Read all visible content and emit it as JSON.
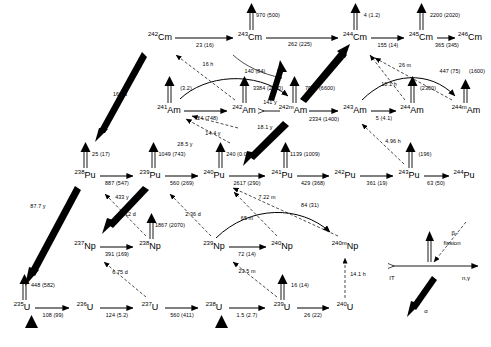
{
  "diagram": {
    "colors": {
      "ink": "#000000",
      "background": "#ffffff"
    },
    "nuclides": [
      {
        "id": "cm242",
        "a": "242",
        "el": "Cm",
        "x": 160,
        "y": 37
      },
      {
        "id": "cm243",
        "a": "243",
        "el": "Cm",
        "x": 250,
        "y": 37
      },
      {
        "id": "cm244",
        "a": "244",
        "el": "Cm",
        "x": 355,
        "y": 37
      },
      {
        "id": "cm245",
        "a": "245",
        "el": "Cm",
        "x": 421,
        "y": 37
      },
      {
        "id": "cm246",
        "a": "246",
        "el": "Cm",
        "x": 470,
        "y": 37
      },
      {
        "id": "am241",
        "a": "241",
        "el": "Am",
        "x": 169,
        "y": 110
      },
      {
        "id": "am242",
        "a": "242",
        "el": "Am",
        "x": 244,
        "y": 110
      },
      {
        "id": "am242m",
        "a": "242m",
        "el": "Am",
        "x": 293,
        "y": 110
      },
      {
        "id": "am243",
        "a": "243",
        "el": "Am",
        "x": 355,
        "y": 110
      },
      {
        "id": "am244",
        "a": "244",
        "el": "Am",
        "x": 412,
        "y": 110
      },
      {
        "id": "am244m",
        "a": "244m",
        "el": "Am",
        "x": 466,
        "y": 110
      },
      {
        "id": "pu238",
        "a": "238",
        "el": "Pu",
        "x": 85,
        "y": 175
      },
      {
        "id": "pu239",
        "a": "239",
        "el": "Pu",
        "x": 150,
        "y": 175
      },
      {
        "id": "pu240",
        "a": "240",
        "el": "Pu",
        "x": 214,
        "y": 175
      },
      {
        "id": "pu241",
        "a": "241",
        "el": "Pu",
        "x": 282,
        "y": 175
      },
      {
        "id": "pu242",
        "a": "242",
        "el": "Pu",
        "x": 345,
        "y": 175
      },
      {
        "id": "pu243",
        "a": "243",
        "el": "Pu",
        "x": 409,
        "y": 175
      },
      {
        "id": "pu244",
        "a": "244",
        "el": "Pu",
        "x": 464,
        "y": 175
      },
      {
        "id": "np237",
        "a": "237",
        "el": "Np",
        "x": 85,
        "y": 246
      },
      {
        "id": "np238",
        "a": "238",
        "el": "Np",
        "x": 150,
        "y": 246
      },
      {
        "id": "np239",
        "a": "239",
        "el": "Np",
        "x": 214,
        "y": 246
      },
      {
        "id": "np240",
        "a": "240",
        "el": "Np",
        "x": 282,
        "y": 246
      },
      {
        "id": "np240m",
        "a": "240m",
        "el": "Np",
        "x": 345,
        "y": 246
      },
      {
        "id": "u235",
        "a": "235",
        "el": "U",
        "x": 22,
        "y": 307
      },
      {
        "id": "u236",
        "a": "236",
        "el": "U",
        "x": 85,
        "y": 307
      },
      {
        "id": "u237",
        "a": "237",
        "el": "U",
        "x": 150,
        "y": 307
      },
      {
        "id": "u238",
        "a": "238",
        "el": "U",
        "x": 214,
        "y": 307
      },
      {
        "id": "u239",
        "a": "239",
        "el": "U",
        "x": 282,
        "y": 307
      },
      {
        "id": "u240",
        "a": "240",
        "el": "U",
        "x": 345,
        "y": 307
      }
    ],
    "capture_labels": [
      {
        "id": "cm242-cm243",
        "text": "23 (16)",
        "x": 205,
        "y": 46
      },
      {
        "id": "cm243-cm244",
        "text": "262 (225)",
        "x": 300,
        "y": 45
      },
      {
        "id": "cm244-cm245",
        "text": "155 (14)",
        "x": 388,
        "y": 46
      },
      {
        "id": "cm245-cm246",
        "text": "365 (345)",
        "x": 447,
        "y": 46
      },
      {
        "id": "am241-am242",
        "text": "724 (748)",
        "x": 206,
        "y": 119
      },
      {
        "id": "am242m-am243",
        "text": "2334 (1400)",
        "x": 324,
        "y": 120
      },
      {
        "id": "am243-am244",
        "text": "5 (4.1)",
        "x": 384,
        "y": 119
      },
      {
        "id": "pu238-pu239",
        "text": "887 (547)",
        "x": 117,
        "y": 184
      },
      {
        "id": "pu239-pu240",
        "text": "560 (269)",
        "x": 182,
        "y": 184
      },
      {
        "id": "pu240-pu241",
        "text": "2617 (290)",
        "x": 247,
        "y": 184
      },
      {
        "id": "pu241-pu242",
        "text": "429 (368)",
        "x": 313,
        "y": 184
      },
      {
        "id": "pu242-pu243",
        "text": "361 (19)",
        "x": 377,
        "y": 184
      },
      {
        "id": "pu243-pu244",
        "text": "63 (50)",
        "x": 436,
        "y": 184
      },
      {
        "id": "np237-np238",
        "text": "391 (169)",
        "x": 117,
        "y": 255
      },
      {
        "id": "np239-np240",
        "text": "72 (14)",
        "x": 247,
        "y": 255
      },
      {
        "id": "u235-u236",
        "text": "108 (99)",
        "x": 53,
        "y": 316
      },
      {
        "id": "u236-u237",
        "text": "124 (5.2)",
        "x": 117,
        "y": 316
      },
      {
        "id": "u237-u238",
        "text": "560 (411)",
        "x": 182,
        "y": 316
      },
      {
        "id": "u238-u239",
        "text": "1.5 (2.7)",
        "x": 247,
        "y": 316
      },
      {
        "id": "u239-u240",
        "text": "26 (22)",
        "x": 313,
        "y": 316
      }
    ],
    "fission_labels": [
      {
        "id": "cm243-fission",
        "text": "970 (500)",
        "x": 268,
        "y": 16
      },
      {
        "id": "cm244-fission",
        "text": "4 (1.2)",
        "x": 372,
        "y": 16
      },
      {
        "id": "cm245-fission",
        "text": "2200 (2020)",
        "x": 443,
        "y": 16
      },
      {
        "id": "am241-fission",
        "text": "(3.2)",
        "x": 186,
        "y": 89
      },
      {
        "id": "am242-fission",
        "text": "3384 (2900)",
        "x": 268,
        "y": 89
      },
      {
        "id": "am242m-fission",
        "text": "7002 (6600)",
        "x": 318,
        "y": 89
      },
      {
        "id": "am244-fission",
        "text": "(2300)",
        "x": 428,
        "y": 89
      },
      {
        "id": "am244m-fission",
        "text": "(1600)",
        "x": 477,
        "y": 72
      },
      {
        "id": "pu238-fission",
        "text": "25 (17)",
        "x": 101,
        "y": 155
      },
      {
        "id": "pu239-fission",
        "text": "1049 (743)",
        "x": 170,
        "y": 155
      },
      {
        "id": "pu240-fission",
        "text": "240 (0.03)",
        "x": 237,
        "y": 155
      },
      {
        "id": "pu241-fission",
        "text": "1139 (1009)",
        "x": 302,
        "y": 155
      },
      {
        "id": "pu243-fission",
        "text": "(196)",
        "x": 425,
        "y": 155
      },
      {
        "id": "np238-fission",
        "text": "1867 (2070)",
        "x": 168,
        "y": 226
      },
      {
        "id": "u236-fission",
        "text": "448 (582)",
        "x": 41,
        "y": 286
      },
      {
        "id": "u239-fission",
        "text": "16 (14)",
        "x": 299,
        "y": 286
      }
    ],
    "decay_labels": [
      {
        "id": "cm242-pu238-alpha",
        "text": "163 d",
        "x": 120,
        "y": 95
      },
      {
        "id": "am241-cm242-beta",
        "text": "16 h",
        "x": 208,
        "y": 65
      },
      {
        "id": "am242-am242m-it",
        "text": "141 y",
        "x": 270,
        "y": 103
      },
      {
        "id": "cm243-am243-ec",
        "text": "140 (84)",
        "x": 255,
        "y": 72
      },
      {
        "id": "am242m-pu240-alpha",
        "text": "18.1 y",
        "x": 265,
        "y": 128
      },
      {
        "id": "pu239-am241-beta",
        "text": "14.4 y",
        "x": 213,
        "y": 134
      },
      {
        "id": "pu241-am241-beta",
        "text": "28.5 y",
        "x": 185,
        "y": 145
      },
      {
        "id": "pu238-u234-alpha",
        "text": "87.7 y",
        "x": 38,
        "y": 207
      },
      {
        "id": "pu239-u235-alpha",
        "text": "433 y",
        "x": 122,
        "y": 198
      },
      {
        "id": "np238-pu238-beta",
        "text": "2.12 d",
        "x": 128,
        "y": 215
      },
      {
        "id": "np239-pu239-beta",
        "text": "2.36 d",
        "x": 193,
        "y": 215
      },
      {
        "id": "u237-np237-beta",
        "text": "6.75 d",
        "x": 120,
        "y": 273
      },
      {
        "id": "u239-np239-beta",
        "text": "23.5 m",
        "x": 247,
        "y": 272
      },
      {
        "id": "u240-np240m-beta",
        "text": "14.1 h",
        "x": 356,
        "y": 275
      },
      {
        "id": "np240-pu240-beta",
        "text": "65 m",
        "x": 247,
        "y": 219
      },
      {
        "id": "np240m-pu240-beta",
        "text": "7.22 m",
        "x": 267,
        "y": 198
      },
      {
        "id": "np240-np240m-it",
        "text": "84 (31)",
        "x": 310,
        "y": 206
      },
      {
        "id": "pu243-am243-beta",
        "text": "4.96 h",
        "x": 393,
        "y": 142
      },
      {
        "id": "am244-cm244-beta",
        "text": "26 m",
        "x": 405,
        "y": 66
      },
      {
        "id": "am244m-cm244-beta",
        "text": "10.1 h",
        "x": 389,
        "y": 85
      },
      {
        "id": "am243-am244m-ec",
        "text": "447 (75)",
        "x": 450,
        "y": 72
      }
    ],
    "legend": {
      "origin_x": 430,
      "origin_y": 266,
      "items": [
        {
          "id": "legend-beta",
          "text": "β−",
          "x": 455,
          "y": 233
        },
        {
          "id": "legend-fission",
          "text": "fission",
          "x": 449,
          "y": 243
        },
        {
          "id": "legend-it",
          "text": "IT",
          "x": 390,
          "y": 280
        },
        {
          "id": "legend-ngamma",
          "text": "n,γ",
          "x": 466,
          "y": 280
        },
        {
          "id": "legend-alpha",
          "text": "α",
          "x": 424,
          "y": 311
        }
      ]
    }
  }
}
